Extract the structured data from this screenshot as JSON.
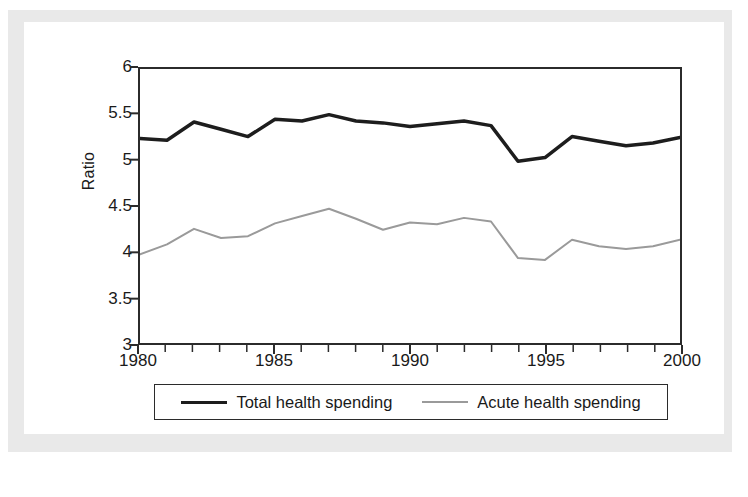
{
  "figure": {
    "y_axis_title": "Ratio"
  },
  "chart_data": {
    "type": "line",
    "title": "",
    "subtitle": "",
    "xlabel": "",
    "ylabel": "Ratio",
    "xlim": [
      1980,
      2000
    ],
    "ylim": [
      3,
      6
    ],
    "grid": false,
    "legend_position": "bottom",
    "y_ticks": [
      "3",
      "3.5",
      "4",
      "4.5",
      "5",
      "5.5",
      "6"
    ],
    "y_tick_values": [
      3,
      3.5,
      4,
      4.5,
      5,
      5.5,
      6
    ],
    "x_ticks": [
      "1980",
      "1985",
      "1990",
      "1995",
      "2000"
    ],
    "x_tick_values": [
      1980,
      1985,
      1990,
      1995,
      2000
    ],
    "x_minor_tick_step": 1,
    "x": [
      1980,
      1981,
      1982,
      1983,
      1984,
      1985,
      1986,
      1987,
      1988,
      1989,
      1990,
      1991,
      1992,
      1993,
      1994,
      1995,
      1996,
      1997,
      1998,
      1999,
      2000
    ],
    "series": [
      {
        "name": "Total health spending",
        "color": "#1d1d1d",
        "line_width": 3.5,
        "values": [
          5.24,
          5.22,
          5.42,
          5.34,
          5.26,
          5.45,
          5.43,
          5.5,
          5.43,
          5.41,
          5.37,
          5.4,
          5.43,
          5.38,
          4.99,
          5.03,
          5.26,
          5.21,
          5.16,
          5.19,
          5.25
        ]
      },
      {
        "name": "Acute health spending",
        "color": "#9a9a9a",
        "line_width": 2,
        "values": [
          3.97,
          4.08,
          4.25,
          4.15,
          4.17,
          4.31,
          4.39,
          4.47,
          4.36,
          4.24,
          4.32,
          4.3,
          4.37,
          4.33,
          3.93,
          3.91,
          4.13,
          4.06,
          4.03,
          4.06,
          4.13
        ]
      }
    ]
  },
  "legend": {
    "entries": [
      {
        "label": "Total health spending",
        "color": "#1d1d1d"
      },
      {
        "label": "Acute health spending",
        "color": "#9a9a9a"
      }
    ]
  },
  "colors": {
    "total_line": "#1d1d1d",
    "acute_line": "#9a9a9a",
    "axis": "#2b2b2b",
    "page_background": "#ffffff",
    "scan_background": "#e9e9e9"
  }
}
